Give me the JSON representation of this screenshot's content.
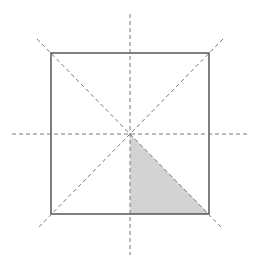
{
  "diagram": {
    "type": "square-symmetry-lines",
    "colors": {
      "background": "#ffffff",
      "square_stroke": "#555555",
      "dashed_stroke": "#7a7a7a",
      "shaded_fill": "#d3d3d3"
    },
    "square": {
      "x1": 51,
      "y1": 53,
      "x2": 209,
      "y2": 214
    },
    "center": {
      "x": 130,
      "y": 134
    },
    "symmetry_lines": [
      {
        "name": "vertical-axis",
        "x1": 130,
        "y1": 14,
        "x2": 130,
        "y2": 255
      },
      {
        "name": "horizontal-axis",
        "x1": 12,
        "y1": 134,
        "x2": 247,
        "y2": 134
      },
      {
        "name": "diagonal-main",
        "x1": 37,
        "y1": 39,
        "x2": 223,
        "y2": 229
      },
      {
        "name": "diagonal-anti",
        "x1": 223,
        "y1": 39,
        "x2": 37,
        "y2": 229
      }
    ],
    "shaded_region": {
      "name": "shaded-triangle",
      "points": [
        [
          130,
          134
        ],
        [
          130,
          214
        ],
        [
          209,
          214
        ]
      ]
    }
  }
}
